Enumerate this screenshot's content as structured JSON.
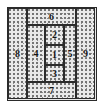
{
  "figure": {
    "kind": "rectangle-dissection-diagram",
    "frame_width": 104,
    "frame_height": 108,
    "fill_style": "stippled",
    "colors": {
      "line": "#2b2b2b",
      "fill": "#e9e9e9",
      "stipple": "#7a7a7a",
      "label": "#141414",
      "page_background": "#ffffff"
    }
  },
  "chart_data": {
    "type": "table",
    "title": "",
    "xlabel": "",
    "ylabel": "",
    "grid": false,
    "legend": null,
    "categories": [
      "1",
      "2",
      "3",
      "4",
      "5",
      "6",
      "7",
      "8",
      "9"
    ],
    "values": [
      1,
      2,
      3,
      4,
      5,
      6,
      7,
      8,
      9
    ],
    "cells": [
      {
        "label": "8",
        "position": "left-full-height-column",
        "x": 0,
        "y": 0,
        "w": 19,
        "h": 91
      },
      {
        "label": "6",
        "position": "top-band",
        "x": 19,
        "y": 0,
        "w": 49,
        "h": 17
      },
      {
        "label": "4",
        "position": "middle-left",
        "x": 19,
        "y": 17,
        "w": 18,
        "h": 57
      },
      {
        "label": "2",
        "position": "center-column-top",
        "x": 37,
        "y": 17,
        "w": 19,
        "h": 20
      },
      {
        "label": "1",
        "position": "center-column-middle",
        "x": 37,
        "y": 37,
        "w": 19,
        "h": 20
      },
      {
        "label": "3",
        "position": "center-column-bottom",
        "x": 37,
        "y": 57,
        "w": 19,
        "h": 17
      },
      {
        "label": "5",
        "position": "middle-right",
        "x": 56,
        "y": 17,
        "w": 12,
        "h": 57
      },
      {
        "label": "7",
        "position": "bottom-band",
        "x": 19,
        "y": 74,
        "w": 49,
        "h": 17
      },
      {
        "label": "9",
        "position": "right-full-height-column",
        "x": 68,
        "y": 0,
        "w": 19,
        "h": 91
      }
    ]
  },
  "labels": {
    "one": "1",
    "two": "2",
    "three": "3",
    "four": "4",
    "five": "5",
    "six": "6",
    "seven": "7",
    "eight": "8",
    "nine": "9"
  }
}
